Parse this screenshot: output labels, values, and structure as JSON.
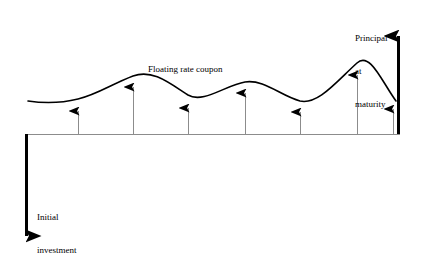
{
  "diagram": {
    "title_text": "Floating rate note cash flow diagram",
    "labels": {
      "floating_rate_coupon": "Floating rate coupon",
      "principal_at_maturity_line1": "Principal",
      "principal_at_maturity_line2": "at",
      "principal_at_maturity_line3": "maturity",
      "initial_investment_line1": "Initial",
      "initial_investment_line2": "investment"
    },
    "colors": {
      "ink": "#000000",
      "background": "#ffffff",
      "timeline": "#8c8c8c",
      "coupon_stem": "#8c8c8c"
    },
    "timeline": {
      "y": 134,
      "x_start": 25,
      "x_end": 400
    },
    "initial_investment_arrow": {
      "x": 26,
      "y_top": 134,
      "y_bottom": 250,
      "direction": "down",
      "thickness": 3
    },
    "principal_arrow": {
      "x": 398,
      "y_base": 134,
      "y_tip": 22,
      "direction": "up",
      "thickness": 3
    },
    "coupon_arrows": [
      {
        "x": 78,
        "y_tip": 100
      },
      {
        "x": 133,
        "y_tip": 76
      },
      {
        "x": 188,
        "y_tip": 97
      },
      {
        "x": 245,
        "y_tip": 82
      },
      {
        "x": 300,
        "y_tip": 101
      },
      {
        "x": 357,
        "y_tip": 64
      },
      {
        "x": 393,
        "y_tip": 98
      }
    ],
    "coupon_curve_path": "M 28,101 C 48,104 62,103 78,99 C 96,95 112,84 133,76 C 152,69 168,82 188,95 C 203,104 226,85 245,82 C 264,79 281,96 300,101 C 318,105 336,82 357,63 C 370,51 382,82 396,101"
  }
}
